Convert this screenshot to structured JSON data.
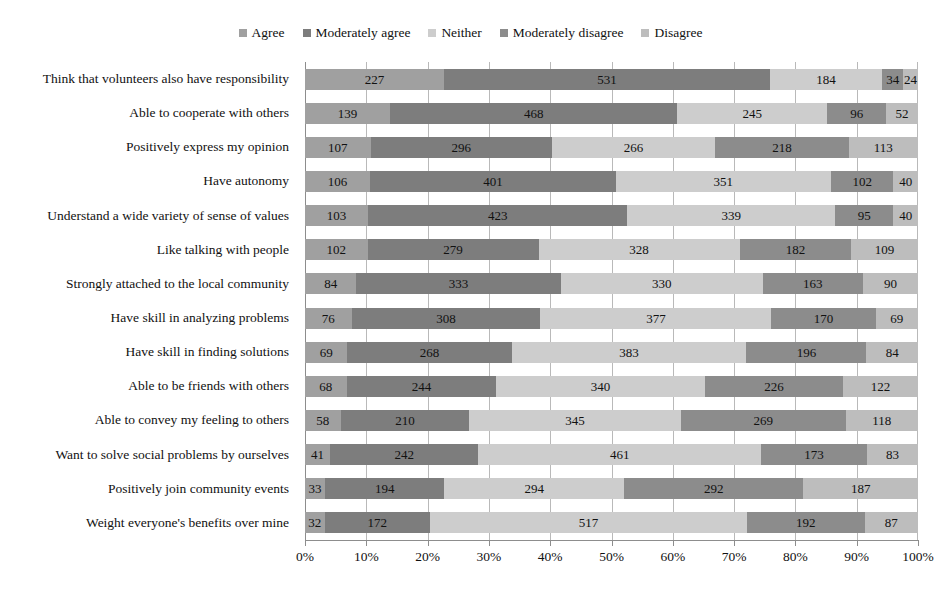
{
  "chart_data": {
    "type": "bar",
    "orientation": "horizontal",
    "stacked": true,
    "normalized_percent": true,
    "title": "",
    "subtitle": "",
    "xlabel": "",
    "ylabel": "",
    "xlim": [
      0,
      100
    ],
    "xtick_labels": [
      "0%",
      "10%",
      "20%",
      "30%",
      "40%",
      "50%",
      "60%",
      "70%",
      "80%",
      "90%",
      "100%"
    ],
    "grid": true,
    "legend_position": "top-center",
    "legend": [
      "Agree",
      "Moderately agree",
      "Neither",
      "Moderately disagree",
      "Disagree"
    ],
    "colors": [
      "#a0a0a0",
      "#7d7d7d",
      "#cdcdcd",
      "#8c8c8c",
      "#bdbdbd"
    ],
    "categories": [
      "Think that volunteers also have responsibility",
      "Able to cooperate with others",
      "Positively express my opinion",
      "Have autonomy",
      "Understand a wide variety of sense of values",
      "Like talking with people",
      "Strongly attached to the local community",
      "Have skill in analyzing problems",
      "Have skill in finding solutions",
      "Able to be friends with others",
      "Able to convey my feeling to others",
      "Want to solve social problems by ourselves",
      "Positively join community events",
      "Weight everyone's benefits over mine"
    ],
    "series": [
      {
        "name": "Agree",
        "color": "#a0a0a0",
        "values": [
          227,
          139,
          107,
          106,
          103,
          102,
          84,
          76,
          69,
          68,
          58,
          41,
          33,
          32
        ]
      },
      {
        "name": "Moderately agree",
        "color": "#7d7d7d",
        "values": [
          531,
          468,
          296,
          401,
          423,
          279,
          333,
          308,
          268,
          244,
          210,
          242,
          194,
          172
        ]
      },
      {
        "name": "Neither",
        "color": "#cdcdcd",
        "values": [
          184,
          245,
          266,
          351,
          339,
          328,
          330,
          377,
          383,
          340,
          345,
          461,
          294,
          517
        ]
      },
      {
        "name": "Moderately disagree",
        "color": "#8c8c8c",
        "values": [
          34,
          96,
          218,
          102,
          95,
          182,
          163,
          170,
          196,
          226,
          269,
          173,
          292,
          192
        ]
      },
      {
        "name": "Disagree",
        "color": "#bdbdbd",
        "values": [
          24,
          52,
          113,
          40,
          40,
          109,
          90,
          69,
          84,
          122,
          118,
          83,
          187,
          87
        ]
      }
    ]
  }
}
